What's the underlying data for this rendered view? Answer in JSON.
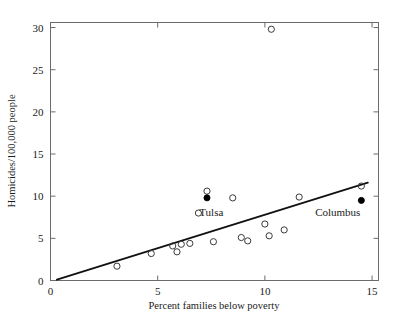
{
  "chart_data": {
    "type": "scatter",
    "title": "",
    "xlabel": "Percent families below poverty",
    "ylabel": "Homicides/100,000 people",
    "xlim": [
      0,
      15.3
    ],
    "ylim": [
      0,
      30.6
    ],
    "xticks": [
      0,
      5,
      10,
      15
    ],
    "xtick_labels": [
      "0",
      "5",
      "10",
      "15"
    ],
    "yticks": [
      0,
      5,
      10,
      15,
      20,
      25,
      30
    ],
    "ytick_labels": [
      "0",
      "5",
      "10",
      "15",
      "20",
      "25",
      "30"
    ],
    "grid": false,
    "legend": "none",
    "points_open": [
      {
        "x": 3.1,
        "y": 1.7
      },
      {
        "x": 4.7,
        "y": 3.2
      },
      {
        "x": 5.7,
        "y": 4.1
      },
      {
        "x": 5.9,
        "y": 3.4
      },
      {
        "x": 6.1,
        "y": 4.3
      },
      {
        "x": 6.5,
        "y": 4.4
      },
      {
        "x": 6.9,
        "y": 8.0
      },
      {
        "x": 7.3,
        "y": 10.6
      },
      {
        "x": 7.6,
        "y": 4.6
      },
      {
        "x": 8.5,
        "y": 9.8
      },
      {
        "x": 8.9,
        "y": 5.1
      },
      {
        "x": 9.2,
        "y": 4.7
      },
      {
        "x": 10.0,
        "y": 6.7
      },
      {
        "x": 10.2,
        "y": 5.3
      },
      {
        "x": 10.3,
        "y": 29.8
      },
      {
        "x": 10.9,
        "y": 6.0
      },
      {
        "x": 11.6,
        "y": 9.9
      },
      {
        "x": 14.5,
        "y": 11.2
      }
    ],
    "points_filled": [
      {
        "x": 7.3,
        "y": 9.8,
        "label": "Tulsa"
      },
      {
        "x": 14.5,
        "y": 9.5,
        "label": "Columbus"
      }
    ],
    "fit_line": {
      "x0": 0.3,
      "y0": 0.1,
      "x1": 14.8,
      "y1": 11.6
    },
    "annotations": [
      {
        "text": "Tulsa",
        "x": 7.5,
        "y": 7.6
      },
      {
        "text": "Columbus",
        "x": 13.4,
        "y": 7.6
      }
    ]
  },
  "axes": {
    "xlabel": "Percent families below poverty",
    "ylabel": "Homicides/100,000 people"
  },
  "labels": {
    "tulsa": "Tulsa",
    "columbus": "Columbus"
  }
}
